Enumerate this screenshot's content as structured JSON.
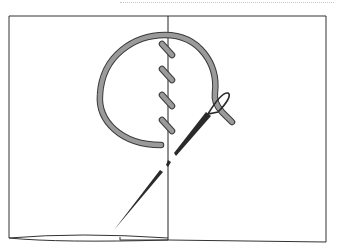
{
  "diagram": {
    "title": "",
    "elements": {
      "fabric_left_panel": "fabric-left",
      "fabric_right_panel": "fabric-right",
      "fold_line": "fold-line",
      "thread_loop": "thread-loop",
      "stitches": [
        "stitch-1",
        "stitch-2",
        "stitch-3",
        "stitch-4"
      ],
      "needle": "needle"
    },
    "colors": {
      "outline": "#222222",
      "thread_fill": "#9a9a9a",
      "thread_outline": "#3a3a3a",
      "needle": "#2a2a2a",
      "background": "#ffffff"
    }
  }
}
